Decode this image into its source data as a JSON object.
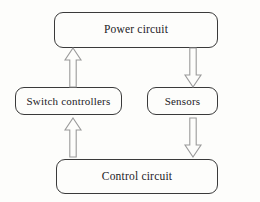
{
  "diagram": {
    "background_color": "#fdfdfb",
    "box_border_color": "#3a3a3a",
    "arrow_outline_color": "#9a9a9a",
    "text_color": "#23211f",
    "nodes": [
      {
        "id": "power",
        "label": "Power circuit"
      },
      {
        "id": "switch",
        "label": "Switch controllers"
      },
      {
        "id": "sensors",
        "label": "Sensors"
      },
      {
        "id": "control",
        "label": "Control circuit"
      }
    ],
    "arrows": [
      {
        "id": "switch-to-power",
        "from": "Switch controllers",
        "to": "Power circuit",
        "direction": "up"
      },
      {
        "id": "power-to-sensors",
        "from": "Power circuit",
        "to": "Sensors",
        "direction": "down"
      },
      {
        "id": "control-to-switch",
        "from": "Control circuit",
        "to": "Switch controllers",
        "direction": "up"
      },
      {
        "id": "sensors-to-control",
        "from": "Sensors",
        "to": "Control circuit",
        "direction": "down"
      }
    ]
  }
}
